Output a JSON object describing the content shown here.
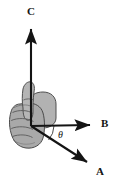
{
  "figure": {
    "kind": "right-hand-rule-vector-diagram",
    "title": "",
    "canvas": {
      "width": 117,
      "height": 189,
      "background": "#ffffff"
    },
    "colors": {
      "background": "#ffffff",
      "vector_stroke": "#141414",
      "label_text": "#141414",
      "hand_fill": "#a9a9a9",
      "hand_fill_light": "#b7b7b7",
      "hand_fill_shadow": "#9a9a9a",
      "hand_outline": "#4a4a4a",
      "hand_crease": "#5a5a5a"
    },
    "origin": {
      "x": 31,
      "y": 126
    },
    "vectors": [
      {
        "name": "C",
        "label": "C",
        "direction": "up",
        "tip": {
          "x": 31,
          "y": 25
        },
        "tail": {
          "x": 31,
          "y": 126
        },
        "label_position": {
          "x": 27,
          "y": 6
        },
        "semantic": "thumb-direction-cross-product"
      },
      {
        "name": "B",
        "label": "B",
        "direction": "right",
        "tip": {
          "x": 95,
          "y": 125
        },
        "tail": {
          "x": 31,
          "y": 126
        },
        "label_position": {
          "x": 101,
          "y": 118
        },
        "semantic": "second-vector-fingers-curl-toward"
      },
      {
        "name": "A",
        "label": "A",
        "direction": "down-right",
        "tip": {
          "x": 92,
          "y": 166
        },
        "tail": {
          "x": 31,
          "y": 126
        },
        "label_position": {
          "x": 96,
          "y": 166
        },
        "semantic": "first-vector-fingers-point-along"
      }
    ],
    "angle": {
      "label": "θ",
      "between": [
        "A",
        "B"
      ],
      "label_position": {
        "x": 58,
        "y": 130
      },
      "arc_radius": 23
    },
    "hand": {
      "name": "right-hand-fist-thumb-up",
      "knuckle_creases": 4,
      "thumb": "extended-upward",
      "palm": "facing-viewer-left"
    }
  }
}
